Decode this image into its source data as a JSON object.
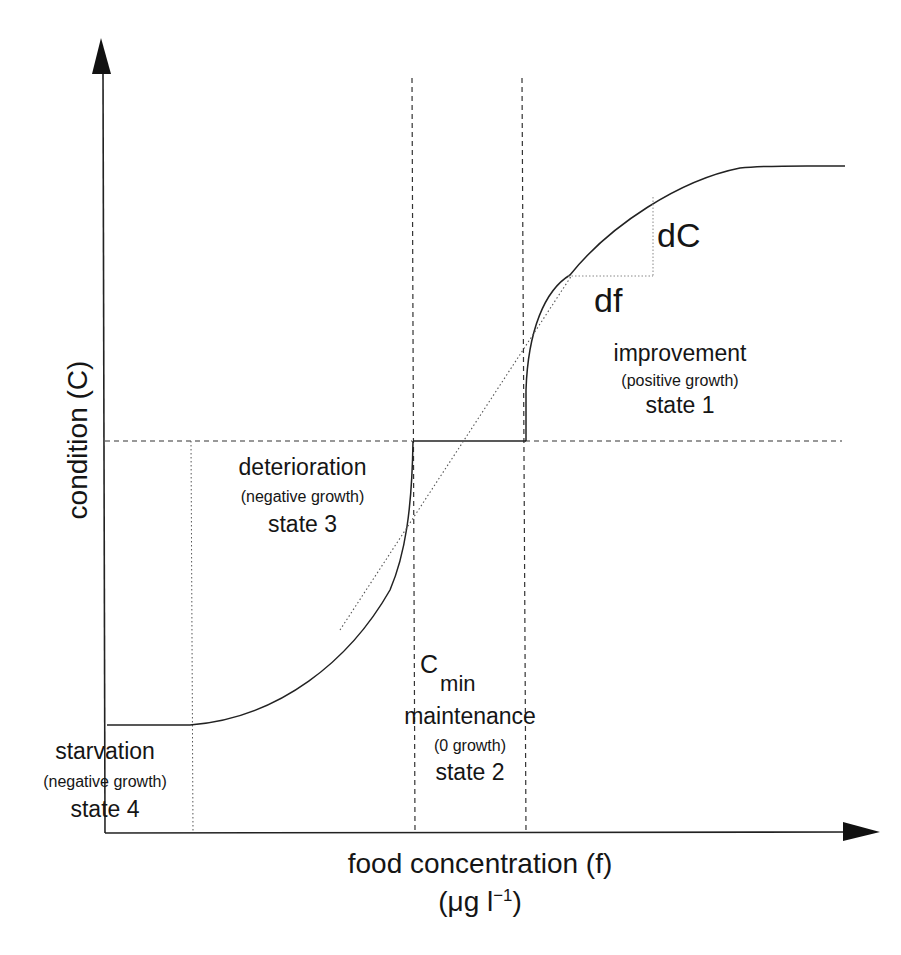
{
  "diagram": {
    "type": "conceptual-curve",
    "axes": {
      "y_label": "condition (C)",
      "x_label": "food concentration (f)",
      "x_unit_prefix": "(μg l",
      "x_unit_exp": "−1",
      "x_unit_suffix": ")"
    },
    "slope_labels": {
      "dC": "dC",
      "df": "df"
    },
    "threshold_label": {
      "symbol": "C",
      "subscript": "min"
    },
    "states": [
      {
        "id": "state1",
        "title": "improvement",
        "growth": "(positive growth)",
        "state": "state 1"
      },
      {
        "id": "state2",
        "title": "maintenance",
        "growth": "(0 growth)",
        "state": "state 2"
      },
      {
        "id": "state3",
        "title": "deterioration",
        "growth": "(negative growth)",
        "state": "state 3"
      },
      {
        "id": "state4",
        "title": "starvation",
        "growth": "(negative growth)",
        "state": "state 4"
      }
    ],
    "colors": {
      "line": "#222222",
      "dashed": "#333333",
      "dotted": "#555555",
      "background": "#ffffff"
    }
  }
}
